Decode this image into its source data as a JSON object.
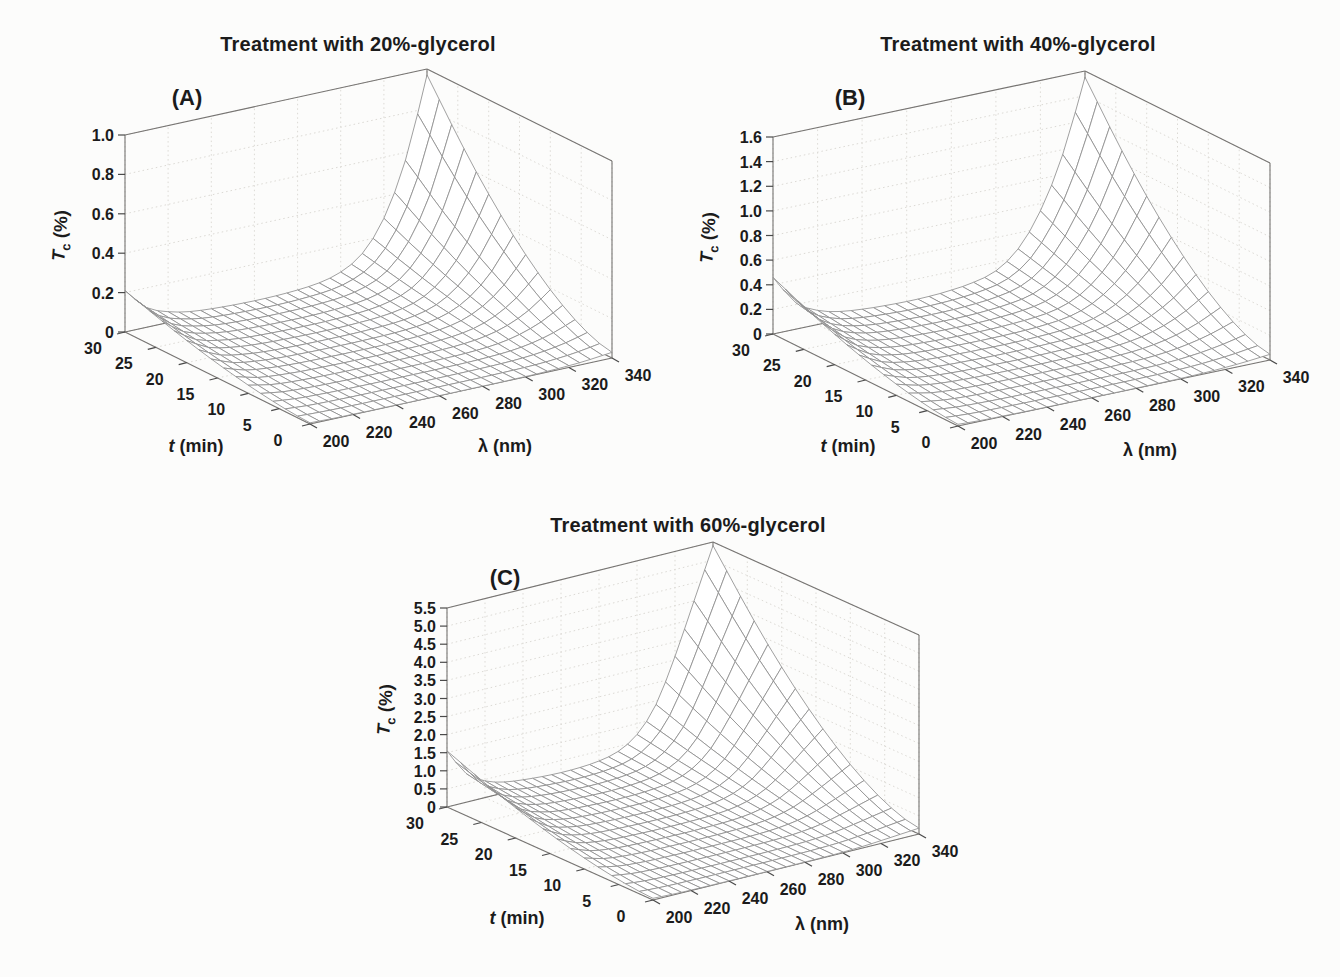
{
  "page": {
    "background": "#fcfcfb",
    "text_color": "#1b1b1b",
    "mesh_line_color": "#8f8f8f",
    "wall_grid_color": "#dcdad5",
    "axis_edge_color": "#767472"
  },
  "chart_data": [
    {
      "type": "surface",
      "panel_label": "(A)",
      "title": "Treatment with 20%-glycerol",
      "xlabel": "λ (nm)",
      "ylabel": "t (min)",
      "zlabel": "Tc (%)",
      "xlabel_parts": {
        "var": "λ",
        "unit": "(nm)"
      },
      "ylabel_parts": {
        "var": "t",
        "unit": "(min)"
      },
      "zlabel_parts": {
        "var": "T",
        "sub": "c",
        "unit": "(%)"
      },
      "xlim": [
        200,
        340
      ],
      "ylim": [
        0,
        30
      ],
      "zlim": [
        0,
        1.0
      ],
      "x_ticks": [
        200,
        220,
        240,
        260,
        280,
        300,
        320,
        340
      ],
      "y_ticks": [
        0,
        5,
        10,
        15,
        20,
        25,
        30
      ],
      "z_tick_labels": [
        "0",
        "0.2",
        "0.4",
        "0.6",
        "0.8",
        "1.0"
      ],
      "surface_model": "Tc(lambda,t) = Tc_at_t30(lambda) * time_scale(t)",
      "lambda_nm": [
        200,
        210,
        220,
        230,
        240,
        250,
        260,
        270,
        280,
        290,
        300,
        310,
        320,
        330,
        340
      ],
      "t_min": [
        0,
        2,
        4,
        6,
        8,
        10,
        12,
        14,
        16,
        18,
        20,
        22,
        24,
        26,
        28,
        30
      ],
      "Tc_at_t30_percent": [
        0.21,
        0.1,
        0.055,
        0.032,
        0.022,
        0.017,
        0.015,
        0.016,
        0.022,
        0.034,
        0.065,
        0.135,
        0.29,
        0.56,
        0.97
      ],
      "time_scale": [
        0.03,
        0.043,
        0.069,
        0.104,
        0.147,
        0.197,
        0.254,
        0.316,
        0.385,
        0.458,
        0.537,
        0.621,
        0.71,
        0.804,
        0.903,
        1.0
      ]
    },
    {
      "type": "surface",
      "panel_label": "(B)",
      "title": "Treatment with 40%-glycerol",
      "xlabel": "λ (nm)",
      "ylabel": "t (min)",
      "zlabel": "Tc (%)",
      "xlabel_parts": {
        "var": "λ",
        "unit": "(nm)"
      },
      "ylabel_parts": {
        "var": "t",
        "unit": "(min)"
      },
      "zlabel_parts": {
        "var": "T",
        "sub": "c",
        "unit": "(%)"
      },
      "xlim": [
        200,
        340
      ],
      "ylim": [
        0,
        30
      ],
      "zlim": [
        0,
        1.6
      ],
      "x_ticks": [
        200,
        220,
        240,
        260,
        280,
        300,
        320,
        340
      ],
      "y_ticks": [
        0,
        5,
        10,
        15,
        20,
        25,
        30
      ],
      "z_tick_labels": [
        "0",
        "0.2",
        "0.4",
        "0.6",
        "0.8",
        "1.0",
        "1.2",
        "1.4",
        "1.6"
      ],
      "surface_model": "Tc(lambda,t) = Tc_at_t30(lambda) * time_scale(t)",
      "lambda_nm": [
        200,
        210,
        220,
        230,
        240,
        250,
        260,
        270,
        280,
        290,
        300,
        310,
        320,
        330,
        340
      ],
      "t_min": [
        0,
        2,
        4,
        6,
        8,
        10,
        12,
        14,
        16,
        18,
        20,
        22,
        24,
        26,
        28,
        30
      ],
      "Tc_at_t30_percent": [
        0.46,
        0.22,
        0.115,
        0.068,
        0.048,
        0.038,
        0.034,
        0.037,
        0.05,
        0.075,
        0.13,
        0.27,
        0.54,
        0.96,
        1.55
      ],
      "time_scale": [
        0.03,
        0.043,
        0.069,
        0.104,
        0.147,
        0.197,
        0.254,
        0.316,
        0.385,
        0.458,
        0.537,
        0.621,
        0.71,
        0.804,
        0.903,
        1.0
      ]
    },
    {
      "type": "surface",
      "panel_label": "(C)",
      "title": "Treatment with 60%-glycerol",
      "xlabel": "λ (nm)",
      "ylabel": "t (min)",
      "zlabel": "Tc (%)",
      "xlabel_parts": {
        "var": "λ",
        "unit": "(nm)"
      },
      "ylabel_parts": {
        "var": "t",
        "unit": "(min)"
      },
      "zlabel_parts": {
        "var": "T",
        "sub": "c",
        "unit": "(%)"
      },
      "xlim": [
        200,
        340
      ],
      "ylim": [
        0,
        30
      ],
      "zlim": [
        0,
        5.5
      ],
      "x_ticks": [
        200,
        220,
        240,
        260,
        280,
        300,
        320,
        340
      ],
      "y_ticks": [
        0,
        5,
        10,
        15,
        20,
        25,
        30
      ],
      "z_tick_labels": [
        "0",
        "0.5",
        "1.0",
        "1.5",
        "2.0",
        "2.5",
        "3.0",
        "3.5",
        "4.0",
        "4.5",
        "5.0",
        "5.5"
      ],
      "surface_model": "Tc(lambda,t) = Tc_at_t30(lambda) * time_scale(t)",
      "lambda_nm": [
        200,
        210,
        220,
        230,
        240,
        250,
        260,
        270,
        280,
        290,
        300,
        310,
        320,
        330,
        340
      ],
      "t_min": [
        0,
        2,
        4,
        6,
        8,
        10,
        12,
        14,
        16,
        18,
        20,
        22,
        24,
        26,
        28,
        30
      ],
      "Tc_at_t30_percent": [
        1.55,
        0.8,
        0.46,
        0.3,
        0.23,
        0.19,
        0.17,
        0.18,
        0.23,
        0.36,
        0.7,
        1.4,
        2.6,
        4.0,
        5.4
      ],
      "time_scale": [
        0.03,
        0.043,
        0.069,
        0.104,
        0.147,
        0.197,
        0.254,
        0.316,
        0.385,
        0.458,
        0.537,
        0.621,
        0.71,
        0.804,
        0.903,
        1.0
      ]
    }
  ]
}
